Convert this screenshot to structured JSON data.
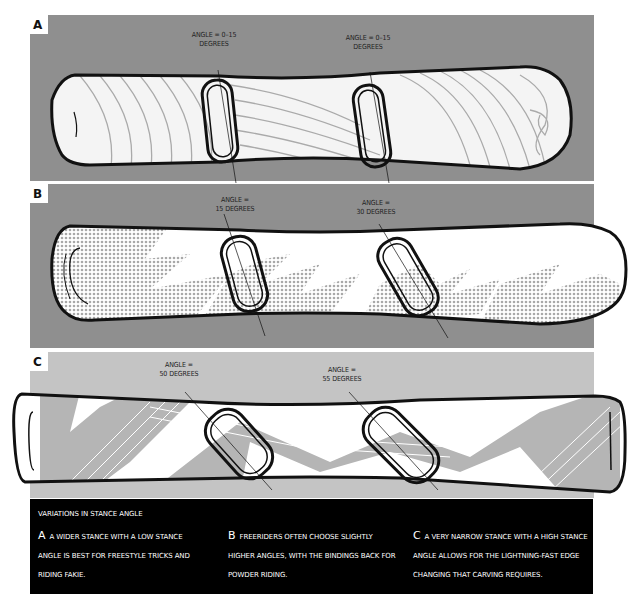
{
  "panels": [
    {
      "id": "A",
      "letter": "A",
      "background": "#8f8f8f",
      "bindings": [
        {
          "label_line1": "ANGLE = 0–15",
          "label_line2": "DEGREES"
        },
        {
          "label_line1": "ANGLE = 0–15",
          "label_line2": "DEGREES"
        }
      ]
    },
    {
      "id": "B",
      "letter": "B",
      "background": "#8f8f8f",
      "bindings": [
        {
          "label_line1": "ANGLE =",
          "label_line2": "15 DEGREES"
        },
        {
          "label_line1": "ANGLE =",
          "label_line2": "30 DEGREES"
        }
      ]
    },
    {
      "id": "C",
      "letter": "C",
      "background": "#c4c4c4",
      "bindings": [
        {
          "label_line1": "ANGLE =",
          "label_line2": "50 DEGREES"
        },
        {
          "label_line1": "ANGLE =",
          "label_line2": "55 DEGREES"
        }
      ]
    }
  ],
  "caption": {
    "title": "VARIATIONS IN STANCE ANGLE",
    "columns": [
      {
        "letter": "A",
        "text": "A WIDER STANCE WITH A LOW STANCE ANGLE IS BEST FOR FREESTYLE TRICKS AND RIDING FAKIE."
      },
      {
        "letter": "B",
        "text": "FREERIDERS OFTEN CHOOSE SLIGHTLY HIGHER ANGLES, WITH THE BINDINGS BACK FOR POWDER RIDING."
      },
      {
        "letter": "C",
        "text": "A VERY NARROW STANCE WITH A HIGH STANCE ANGLE ALLOWS FOR THE LIGHTNING-FAST EDGE CHANGING THAT CARVING REQUIRES."
      }
    ]
  },
  "colors": {
    "panel_dark": "#8f8f8f",
    "panel_light": "#c4c4c4",
    "board": "#ffffff",
    "outline": "#111111",
    "pattern": "#a8a8a8",
    "caption_bg": "#000000",
    "caption_text": "#ffffff"
  }
}
